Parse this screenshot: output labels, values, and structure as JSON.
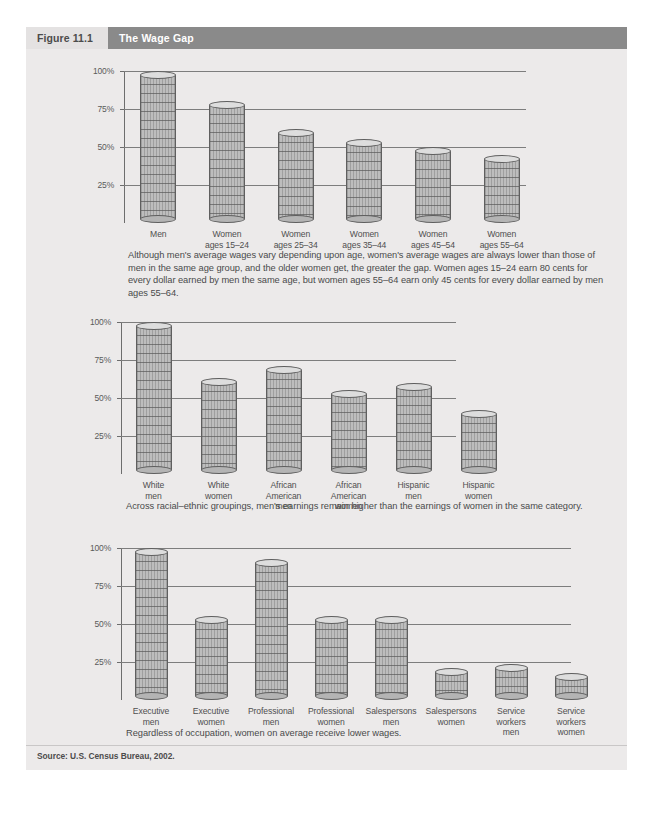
{
  "figure": {
    "number": "Figure 11.1",
    "title": "The Wage Gap",
    "source": "Source: U.S. Census Bureau, 2002."
  },
  "captions": {
    "chart1": "Although men's average wages vary depending upon age, women's average wages are always lower than those of men in the same age group, and the older women get, the greater the gap. Women ages 15–24 earn 80 cents for every dollar earned by men the same age, but women ages 55–64 earn only 45 cents for every dollar earned by men ages 55–64.",
    "chart2": "Across racial–ethnic groupings, men's earnings remain higher than the earnings of women in the same category.",
    "chart3": "Regardless of occupation, women on average receive lower wages."
  },
  "chart_data": [
    {
      "type": "bar",
      "title": "Wage gap by age",
      "xlabel": "",
      "ylabel": "",
      "ylim": [
        0,
        100
      ],
      "yticks": [
        "25%",
        "50%",
        "75%",
        "100%"
      ],
      "grid": true,
      "categories": [
        "Men",
        "Women\nages 15–24",
        "Women\nages 25–34",
        "Women\nages 35–44",
        "Women\nages 45–54",
        "Women\nages 55–64"
      ],
      "category_lines": [
        [
          "Men"
        ],
        [
          "Women",
          "ages 15–24"
        ],
        [
          "Women",
          "ages 25–34"
        ],
        [
          "Women",
          "ages 35–44"
        ],
        [
          "Women",
          "ages 45–54"
        ],
        [
          "Women",
          "ages 55–64"
        ]
      ],
      "values": [
        100,
        80,
        62,
        55,
        50,
        45
      ]
    },
    {
      "type": "bar",
      "title": "Wage gap by racial-ethnic grouping",
      "xlabel": "",
      "ylabel": "",
      "ylim": [
        0,
        100
      ],
      "yticks": [
        "25%",
        "50%",
        "75%",
        "100%"
      ],
      "grid": true,
      "categories": [
        "White\nmen",
        "White\nwomen",
        "African\nAmerican\nmen",
        "African\nAmerican\nwomen",
        "Hispanic\nmen",
        "Hispanic\nwomen"
      ],
      "category_lines": [
        [
          "White",
          "men"
        ],
        [
          "White",
          "women"
        ],
        [
          "African",
          "American",
          "men"
        ],
        [
          "African",
          "American",
          "women"
        ],
        [
          "Hispanic",
          "men"
        ],
        [
          "Hispanic",
          "women"
        ]
      ],
      "values": [
        100,
        63,
        71,
        55,
        60,
        42
      ]
    },
    {
      "type": "bar",
      "title": "Wage gap by occupation",
      "xlabel": "",
      "ylabel": "",
      "ylim": [
        0,
        100
      ],
      "yticks": [
        "25%",
        "50%",
        "75%",
        "100%"
      ],
      "grid": true,
      "categories": [
        "Executive\nmen",
        "Executive\nwomen",
        "Professional\nmen",
        "Professional\nwomen",
        "Salespersons\nmen",
        "Salespersons\nwomen",
        "Service\nworkers\nmen",
        "Service\nworkers\nwomen"
      ],
      "category_lines": [
        [
          "Executive",
          "men"
        ],
        [
          "Executive",
          "women"
        ],
        [
          "Professional",
          "men"
        ],
        [
          "Professional",
          "women"
        ],
        [
          "Salespersons",
          "men"
        ],
        [
          "Salespersons",
          "women"
        ],
        [
          "Service",
          "workers",
          "men"
        ],
        [
          "Service",
          "workers",
          "women"
        ]
      ],
      "values": [
        100,
        55,
        93,
        55,
        55,
        21,
        24,
        18
      ]
    }
  ],
  "colors": {
    "page_bg": "#eceaea",
    "header_bg": "#e4e2e2",
    "title_bg": "#8a8a8a",
    "bar_fill": "#bdbdbd",
    "bar_stroke": "#5f5f5f",
    "grid": "#7d7d7d",
    "text": "#4a4a4a"
  }
}
